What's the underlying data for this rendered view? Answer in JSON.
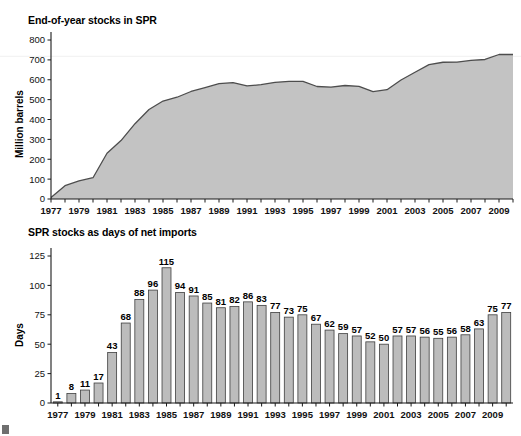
{
  "figure": {
    "background_color": "#ffffff",
    "area_fill_color": "#c3c3c3",
    "area_line_color": "#4d4d4d",
    "bar_fill_color": "#bcbcbc",
    "bar_edge_color": "#3f3f3f"
  },
  "panels": {
    "top": {
      "title": "End-of-year stocks in SPR",
      "ylabel": "Million barrels"
    },
    "bottom": {
      "title": "SPR stocks as days of net imports",
      "ylabel": "Days"
    }
  },
  "chart_data": [
    {
      "type": "area",
      "title": "End-of-year stocks in SPR",
      "xlabel": "",
      "ylabel": "Million barrels",
      "ylim": [
        0,
        800
      ],
      "yticks": [
        0,
        100,
        200,
        300,
        400,
        500,
        600,
        700,
        800
      ],
      "ytick_labels": [
        "0",
        "100",
        "200",
        "300",
        "400",
        "500",
        "600",
        "700",
        "800"
      ],
      "xlim": [
        1977,
        2010
      ],
      "xticks": [
        1977,
        1978,
        1979,
        1980,
        1981,
        1982,
        1983,
        1984,
        1985,
        1986,
        1987,
        1988,
        1989,
        1990,
        1991,
        1992,
        1993,
        1994,
        1995,
        1996,
        1997,
        1998,
        1999,
        2000,
        2001,
        2002,
        2003,
        2004,
        2005,
        2006,
        2007,
        2008,
        2009,
        2010
      ],
      "xtick_labels_shown": [
        "1977",
        "1979",
        "1981",
        "1983",
        "1985",
        "1987",
        "1989",
        "1991",
        "1993",
        "1995",
        "1997",
        "1999",
        "2001",
        "2003",
        "2005",
        "2007",
        "2009"
      ],
      "grid": false,
      "x": [
        1977,
        1978,
        1979,
        1980,
        1981,
        1982,
        1983,
        1984,
        1985,
        1986,
        1987,
        1988,
        1989,
        1990,
        1991,
        1992,
        1993,
        1994,
        1995,
        1996,
        1997,
        1998,
        1999,
        2000,
        2001,
        2002,
        2003,
        2004,
        2005,
        2006,
        2007,
        2008,
        2009,
        2010
      ],
      "values": [
        7,
        67,
        91,
        107,
        230,
        294,
        379,
        450,
        493,
        512,
        541,
        560,
        580,
        586,
        569,
        575,
        587,
        592,
        592,
        566,
        563,
        571,
        567,
        540,
        550,
        599,
        638,
        676,
        688,
        689,
        697,
        702,
        727,
        727
      ],
      "note": "values read off the shaded area outline in million barrels"
    },
    {
      "type": "bar",
      "title": "SPR stocks as days of net imports",
      "xlabel": "",
      "ylabel": "Days",
      "ylim": [
        0,
        125
      ],
      "yticks": [
        0,
        25,
        50,
        75,
        100,
        125
      ],
      "ytick_labels": [
        "0",
        "25",
        "50",
        "75",
        "100",
        "125"
      ],
      "grid": false,
      "categories": [
        "1977",
        "1978",
        "1979",
        "1980",
        "1981",
        "1982",
        "1983",
        "1984",
        "1985",
        "1986",
        "1987",
        "1988",
        "1989",
        "1990",
        "1991",
        "1992",
        "1993",
        "1994",
        "1995",
        "1996",
        "1997",
        "1998",
        "1999",
        "2000",
        "2001",
        "2002",
        "2003",
        "2004",
        "2005",
        "2006",
        "2007",
        "2008",
        "2009",
        "2010"
      ],
      "xtick_labels_shown": [
        "1977",
        "1979",
        "1981",
        "1983",
        "1985",
        "1987",
        "1989",
        "1991",
        "1993",
        "1995",
        "1997",
        "1999",
        "2001",
        "2003",
        "2005",
        "2007",
        "2009"
      ],
      "values": [
        1,
        8,
        11,
        17,
        43,
        68,
        88,
        96,
        115,
        94,
        91,
        85,
        81,
        82,
        86,
        83,
        77,
        73,
        75,
        67,
        62,
        59,
        57,
        52,
        50,
        57,
        57,
        56,
        55,
        56,
        58,
        63,
        75,
        77
      ],
      "data_labels": [
        "1",
        "8",
        "11",
        "17",
        "43",
        "68",
        "88",
        "96",
        "115",
        "94",
        "91",
        "85",
        "81",
        "82",
        "86",
        "83",
        "77",
        "73",
        "75",
        "67",
        "62",
        "59",
        "57",
        "52",
        "50",
        "57",
        "57",
        "56",
        "55",
        "56",
        "58",
        "63",
        "75",
        "77"
      ]
    }
  ]
}
